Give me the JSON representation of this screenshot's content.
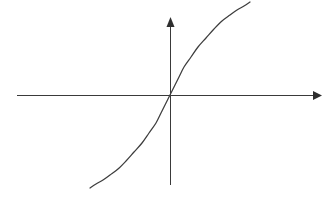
{
  "figure": {
    "title": "",
    "background_color": "#ffffff",
    "width": 329,
    "height": 200
  },
  "axes": {
    "line_color": "#3a3a3a",
    "arrow_color": "#2e2e2e",
    "origin": {
      "x": 170,
      "y": 95
    },
    "x_axis": {
      "name": "horizontal-axis",
      "label": "",
      "start": {
        "x": 17,
        "y": 95
      },
      "end": {
        "x": 322,
        "y": 95
      },
      "arrow": "right",
      "ticks": [],
      "tick_labels": []
    },
    "y_axis": {
      "name": "vertical-axis",
      "label": "",
      "start": {
        "x": 170,
        "y": 185
      },
      "end": {
        "x": 170,
        "y": 17
      },
      "arrow": "up",
      "ticks": [],
      "tick_labels": []
    }
  },
  "chart_data": {
    "type": "line",
    "title": "",
    "subtitle": "",
    "xlabel": "",
    "ylabel": "",
    "grid": false,
    "legend": [],
    "legend_position": "none",
    "annotations": [],
    "xlim": [
      -1.0,
      1.05
    ],
    "ylim": [
      -1.05,
      1.0
    ],
    "series": [
      {
        "name": "curve",
        "color": "#3d3d3d",
        "x": [
          -1.0,
          -0.93,
          -0.85,
          -0.76,
          -0.66,
          -0.56,
          -0.46,
          -0.36,
          -0.27,
          -0.18,
          -0.11,
          -0.055,
          -0.02,
          0.0,
          0.02,
          0.055,
          0.11,
          0.18,
          0.27,
          0.36,
          0.46,
          0.56,
          0.66,
          0.76,
          0.85,
          0.93,
          1.0
        ],
        "y": [
          -1.0,
          -0.93,
          -0.855,
          -0.775,
          -0.69,
          -0.6,
          -0.51,
          -0.42,
          -0.335,
          -0.245,
          -0.16,
          -0.09,
          -0.035,
          0.0,
          0.035,
          0.09,
          0.16,
          0.245,
          0.335,
          0.42,
          0.51,
          0.6,
          0.69,
          0.775,
          0.855,
          0.93,
          1.0
        ],
        "pixel_points": [
          {
            "x": 90,
            "y": 188
          },
          {
            "x": 96,
            "y": 184
          },
          {
            "x": 103,
            "y": 180
          },
          {
            "x": 110,
            "y": 175
          },
          {
            "x": 118,
            "y": 169
          },
          {
            "x": 126,
            "y": 161
          },
          {
            "x": 134,
            "y": 152
          },
          {
            "x": 142,
            "y": 143
          },
          {
            "x": 149,
            "y": 133
          },
          {
            "x": 156,
            "y": 123
          },
          {
            "x": 161,
            "y": 113
          },
          {
            "x": 165,
            "y": 105
          },
          {
            "x": 168,
            "y": 99
          },
          {
            "x": 170,
            "y": 95
          },
          {
            "x": 172,
            "y": 91
          },
          {
            "x": 175,
            "y": 85
          },
          {
            "x": 179,
            "y": 77
          },
          {
            "x": 184,
            "y": 67
          },
          {
            "x": 191,
            "y": 57
          },
          {
            "x": 198,
            "y": 47
          },
          {
            "x": 206,
            "y": 38
          },
          {
            "x": 214,
            "y": 29
          },
          {
            "x": 222,
            "y": 21
          },
          {
            "x": 230,
            "y": 15
          },
          {
            "x": 237,
            "y": 10
          },
          {
            "x": 244,
            "y": 6
          },
          {
            "x": 250,
            "y": 2
          }
        ],
        "start_pixel": {
          "x": 90,
          "y": 188
        },
        "end_pixel": {
          "x": 293,
          "y": 36
        }
      }
    ]
  }
}
